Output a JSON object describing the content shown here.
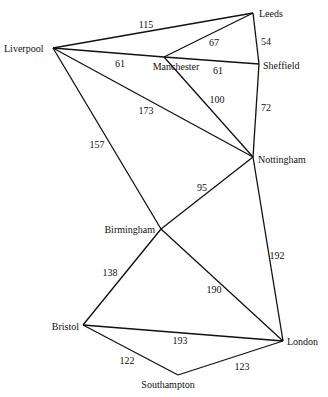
{
  "graph": {
    "nodes": [
      {
        "id": "liverpool",
        "label": "Liverpool",
        "x": 53,
        "y": 48,
        "lx": 4,
        "ly": 52,
        "anchor": "start"
      },
      {
        "id": "leeds",
        "label": "Leeds",
        "x": 253,
        "y": 13,
        "lx": 259,
        "ly": 17,
        "anchor": "start"
      },
      {
        "id": "manchester",
        "label": "Manchester",
        "x": 164,
        "y": 57,
        "lx": 176,
        "ly": 70,
        "anchor": "middle"
      },
      {
        "id": "sheffield",
        "label": "Sheffield",
        "x": 259,
        "y": 64,
        "lx": 263,
        "ly": 69,
        "anchor": "start"
      },
      {
        "id": "nottingham",
        "label": "Nottingham",
        "x": 253,
        "y": 157,
        "lx": 258,
        "ly": 163,
        "anchor": "start"
      },
      {
        "id": "birmingham",
        "label": "Birmingham",
        "x": 161,
        "y": 229,
        "lx": 155,
        "ly": 233,
        "anchor": "end"
      },
      {
        "id": "bristol",
        "label": "Bristol",
        "x": 83,
        "y": 325,
        "lx": 79,
        "ly": 330,
        "anchor": "end"
      },
      {
        "id": "london",
        "label": "London",
        "x": 283,
        "y": 341,
        "lx": 287,
        "ly": 345,
        "anchor": "start"
      },
      {
        "id": "southampton",
        "label": "Southampton",
        "x": 178,
        "y": 375,
        "lx": 168,
        "ly": 388,
        "anchor": "middle"
      }
    ],
    "edges": [
      {
        "from": "liverpool",
        "to": "leeds",
        "weight": "115",
        "wx": 146,
        "wy": 28
      },
      {
        "from": "liverpool",
        "to": "manchester",
        "weight": "61",
        "wx": 120,
        "wy": 67
      },
      {
        "from": "leeds",
        "to": "manchester",
        "weight": "67",
        "wx": 214,
        "wy": 46
      },
      {
        "from": "leeds",
        "to": "sheffield",
        "weight": "54",
        "wx": 266,
        "wy": 45
      },
      {
        "from": "manchester",
        "to": "sheffield",
        "weight": "61",
        "wx": 218,
        "wy": 74
      },
      {
        "from": "liverpool",
        "to": "nottingham",
        "weight": "173",
        "wx": 146,
        "wy": 114
      },
      {
        "from": "manchester",
        "to": "nottingham",
        "weight": "100",
        "wx": 217,
        "wy": 103
      },
      {
        "from": "sheffield",
        "to": "nottingham",
        "weight": "72",
        "wx": 266,
        "wy": 111
      },
      {
        "from": "liverpool",
        "to": "birmingham",
        "weight": "157",
        "wx": 97,
        "wy": 148
      },
      {
        "from": "nottingham",
        "to": "birmingham",
        "weight": "95",
        "wx": 202,
        "wy": 191
      },
      {
        "from": "nottingham",
        "to": "london",
        "weight": "192",
        "wx": 277,
        "wy": 259
      },
      {
        "from": "birmingham",
        "to": "bristol",
        "weight": "138",
        "wx": 110,
        "wy": 276
      },
      {
        "from": "birmingham",
        "to": "london",
        "weight": "190",
        "wx": 214,
        "wy": 293
      },
      {
        "from": "bristol",
        "to": "london",
        "weight": "193",
        "wx": 180,
        "wy": 344
      },
      {
        "from": "bristol",
        "to": "southampton",
        "weight": "122",
        "wx": 127,
        "wy": 364
      },
      {
        "from": "southampton",
        "to": "london",
        "weight": "123",
        "wx": 242,
        "wy": 370
      }
    ]
  }
}
